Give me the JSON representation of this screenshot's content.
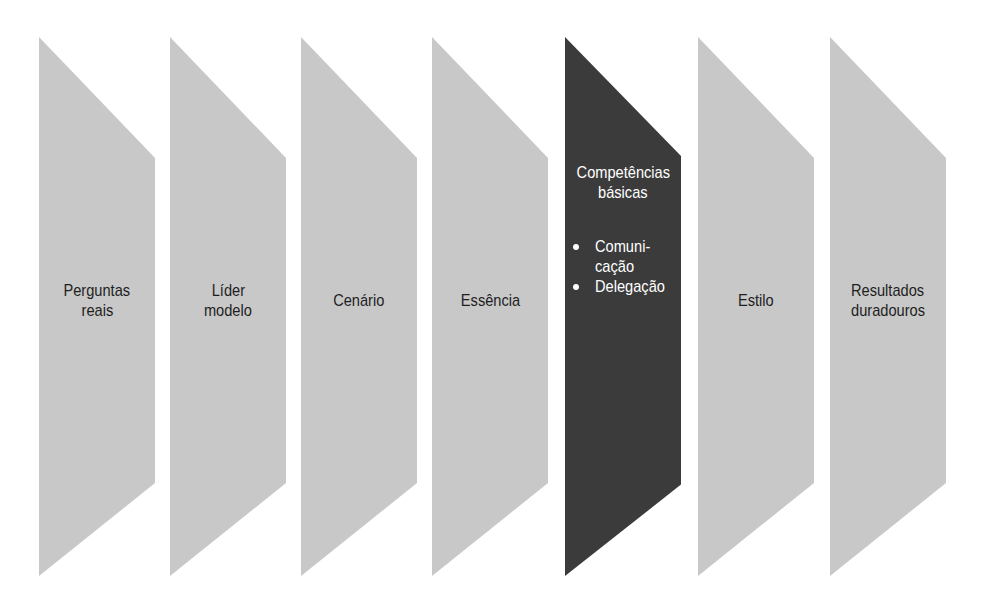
{
  "diagram": {
    "type": "chevron-process",
    "colors": {
      "inactive": "#c8c8c8",
      "active": "#3b3b3b",
      "inactive_text": "#1e1e1e",
      "active_text": "#ffffff"
    },
    "steps": [
      {
        "lines": [
          "Perguntas",
          "reais"
        ],
        "active": false
      },
      {
        "lines": [
          "Líder",
          "modelo"
        ],
        "active": false
      },
      {
        "lines": [
          "Cenário"
        ],
        "active": false
      },
      {
        "lines": [
          "Essência"
        ],
        "active": false
      },
      {
        "lines": [
          "Competências",
          "básicas"
        ],
        "active": true,
        "bullets": [
          [
            "Comuni-",
            "cação"
          ],
          [
            "Delegação"
          ]
        ]
      },
      {
        "lines": [
          "Estilo"
        ],
        "active": false
      },
      {
        "lines": [
          "Resultados",
          "duradouros"
        ],
        "active": false
      }
    ]
  }
}
